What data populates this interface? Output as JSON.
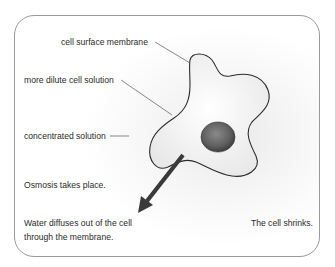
{
  "diagram": {
    "labels": {
      "membrane": "cell surface membrane",
      "cell_solution": "more dilute cell solution",
      "outside_solution": "concentrated solution"
    },
    "statements": {
      "process": "Osmosis takes place.",
      "water_line1": "Water diffuses out of the cell",
      "water_line2": "through the membrane.",
      "result": "The cell shrinks."
    },
    "colors": {
      "frame_border": "#9a9a9a",
      "cell_outline": "#2b2b2b",
      "cell_fill": "#f4f4f4",
      "nucleus": "#6a6a6a",
      "arrow": "#3a3a3a",
      "leader_line": "#555555",
      "text": "#2a2a2a"
    }
  }
}
